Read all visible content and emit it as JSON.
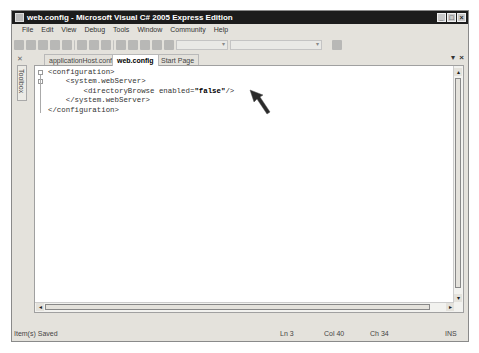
{
  "window": {
    "title": "web.config - Microsoft Visual C# 2005 Express Edition",
    "controls": {
      "minimize": "_",
      "maximize": "□",
      "close": "×"
    }
  },
  "menubar": {
    "items": [
      "File",
      "Edit",
      "View",
      "Debug",
      "Tools",
      "Window",
      "Community",
      "Help"
    ]
  },
  "toolbox": {
    "label": "Toolbox"
  },
  "tabs": [
    {
      "label": "applicationHost.config",
      "active": false
    },
    {
      "label": "web.config",
      "active": true
    },
    {
      "label": "Start Page",
      "active": false
    }
  ],
  "tab_controls": {
    "dropdown": "▾",
    "close": "×"
  },
  "editor": {
    "lines": [
      {
        "indent": "",
        "text": "<configuration>"
      },
      {
        "indent": "    ",
        "text": "<system.webServer>"
      },
      {
        "indent": "        ",
        "text_before": "<directoryBrowse enabled=",
        "value": "\"false\"",
        "text_after": "/>"
      },
      {
        "indent": "    ",
        "text": "</system.webServer>"
      },
      {
        "indent": "",
        "text": "</configuration>"
      }
    ]
  },
  "statusbar": {
    "message": "Item(s) Saved",
    "line": "Ln 3",
    "col": "Col 40",
    "ch": "Ch 34",
    "mode": "INS"
  }
}
